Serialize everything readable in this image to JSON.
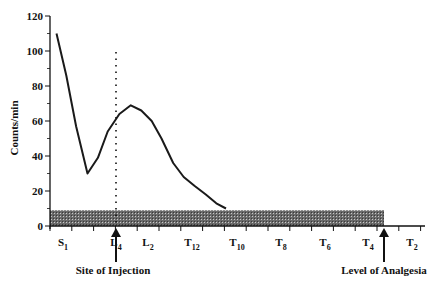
{
  "chart_data": {
    "type": "line",
    "title": "",
    "xlabel": "",
    "ylabel": "Counts/min",
    "ylim": [
      0,
      120
    ],
    "yticks": [
      0,
      20,
      40,
      60,
      80,
      100,
      120
    ],
    "grid": false,
    "legend": null,
    "x_tick_labels": [
      {
        "base": "S",
        "sub": "1"
      },
      {
        "base": "L",
        "sub": "4"
      },
      {
        "base": "L",
        "sub": "2"
      },
      {
        "base": "T",
        "sub": "12"
      },
      {
        "base": "T",
        "sub": "10"
      },
      {
        "base": "T",
        "sub": "8"
      },
      {
        "base": "T",
        "sub": "6"
      },
      {
        "base": "T",
        "sub": "4"
      },
      {
        "base": "T",
        "sub": "2"
      }
    ],
    "series": [
      {
        "name": "Counts/min",
        "points": [
          {
            "x": 0.2,
            "y": 110
          },
          {
            "x": 0.5,
            "y": 86
          },
          {
            "x": 0.8,
            "y": 57
          },
          {
            "x": 1.15,
            "y": 30
          },
          {
            "x": 1.47,
            "y": 39
          },
          {
            "x": 1.77,
            "y": 54
          },
          {
            "x": 2.13,
            "y": 64
          },
          {
            "x": 2.48,
            "y": 69
          },
          {
            "x": 2.8,
            "y": 66
          },
          {
            "x": 3.12,
            "y": 60
          },
          {
            "x": 3.42,
            "y": 50
          },
          {
            "x": 3.78,
            "y": 36
          },
          {
            "x": 4.1,
            "y": 28
          },
          {
            "x": 4.43,
            "y": 23
          },
          {
            "x": 4.78,
            "y": 18
          },
          {
            "x": 5.1,
            "y": 13
          },
          {
            "x": 5.4,
            "y": 10
          }
        ]
      }
    ],
    "bands": [
      {
        "name": "anesthetic-spread-bar",
        "from_label": "S1",
        "to_label": "T4 (Level of Analgesia)",
        "y_from": 0,
        "y_to": 9,
        "fill": "hatched-gray"
      }
    ],
    "annotations": [
      {
        "text": "Site of Injection",
        "at": "L4",
        "type": "arrow-up",
        "vertical_dotted_line": true
      },
      {
        "text": "Level of Analgesia",
        "at": "T4",
        "type": "arrow-up"
      }
    ]
  },
  "labels": {
    "ylabel": "Counts/min",
    "site_of_injection": "Site of Injection",
    "level_of_analgesia": "Level of Analgesia",
    "caption_partial": "Figure ..."
  }
}
